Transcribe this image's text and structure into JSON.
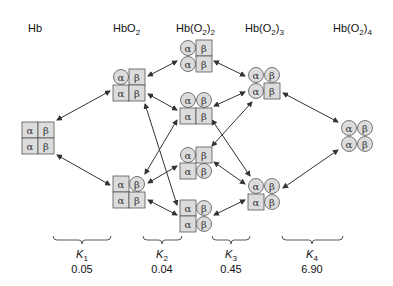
{
  "diagram": {
    "columns": [
      {
        "id": "hb",
        "label": "Hb",
        "x": 28
      },
      {
        "id": "hbo2",
        "label": "HbO",
        "sub": "2",
        "x": 113
      },
      {
        "id": "hbo2_2",
        "label": "Hb(O",
        "sub1": "2",
        "mid": ")",
        "sub2": "2",
        "x": 176
      },
      {
        "id": "hbo2_3",
        "label": "Hb(O",
        "sub1": "2",
        "mid": ")",
        "sub2": "3",
        "x": 245
      },
      {
        "id": "hbo2_4",
        "label": "Hb(O",
        "sub1": "2",
        "mid": ")",
        "sub2": "4",
        "x": 333
      }
    ],
    "subunit_glyphs": {
      "alpha": "α",
      "beta": "β"
    },
    "colors": {
      "fill": "#dcdcdc",
      "stroke": "#555555",
      "arrow": "#333333",
      "text": "#111111"
    },
    "states": [
      {
        "id": "hb",
        "x": 22,
        "y": 122,
        "cells": [
          "sq",
          "sq",
          "sq",
          "sq"
        ]
      },
      {
        "id": "hbo2-a",
        "x": 113,
        "y": 69,
        "cells": [
          "ci",
          "sq",
          "sq",
          "sq"
        ]
      },
      {
        "id": "hbo2-b",
        "x": 113,
        "y": 176,
        "cells": [
          "sq",
          "ci",
          "sq",
          "sq"
        ]
      },
      {
        "id": "hbo2_2-a",
        "x": 180,
        "y": 40,
        "cells": [
          "ci",
          "sq",
          "ci",
          "sq"
        ]
      },
      {
        "id": "hbo2_2-b",
        "x": 180,
        "y": 92,
        "cells": [
          "ci",
          "ci",
          "sq",
          "sq"
        ]
      },
      {
        "id": "hbo2_2-c",
        "x": 180,
        "y": 147,
        "cells": [
          "ci",
          "sq",
          "sq",
          "ci"
        ]
      },
      {
        "id": "hbo2_2-d",
        "x": 180,
        "y": 200,
        "cells": [
          "sq",
          "ci",
          "sq",
          "ci"
        ]
      },
      {
        "id": "hbo2_3-a",
        "x": 248,
        "y": 67,
        "cells": [
          "ci",
          "ci",
          "ci",
          "sq"
        ]
      },
      {
        "id": "hbo2_3-b",
        "x": 248,
        "y": 178,
        "cells": [
          "ci",
          "ci",
          "sq",
          "ci"
        ]
      },
      {
        "id": "hbo2_4",
        "x": 341,
        "y": 120,
        "cells": [
          "ci",
          "ci",
          "ci",
          "ci"
        ]
      }
    ],
    "arrows": [
      {
        "from": "hb",
        "to": "hbo2-a",
        "x1": 57,
        "y1": 120,
        "x2": 110,
        "y2": 91
      },
      {
        "from": "hb",
        "to": "hbo2-b",
        "x1": 57,
        "y1": 155,
        "x2": 110,
        "y2": 185
      },
      {
        "from": "hbo2-a",
        "to": "hbo2_2-a",
        "x1": 148,
        "y1": 76,
        "x2": 177,
        "y2": 61
      },
      {
        "from": "hbo2-a",
        "to": "hbo2_2-b",
        "x1": 148,
        "y1": 94,
        "x2": 177,
        "y2": 110
      },
      {
        "from": "hbo2-a",
        "to": "hbo2_2-d",
        "x1": 145,
        "y1": 104,
        "x2": 177,
        "y2": 205
      },
      {
        "from": "hbo2-b",
        "to": "hbo2_2-c",
        "x1": 148,
        "y1": 183,
        "x2": 177,
        "y2": 166
      },
      {
        "from": "hbo2-b",
        "to": "hbo2_2-d",
        "x1": 148,
        "y1": 200,
        "x2": 177,
        "y2": 215
      },
      {
        "from": "hbo2-b",
        "to": "hbo2_2-b",
        "x1": 145,
        "y1": 174,
        "x2": 177,
        "y2": 120
      },
      {
        "from": "hbo2_2-a",
        "to": "hbo2_3-a",
        "x1": 214,
        "y1": 61,
        "x2": 245,
        "y2": 76
      },
      {
        "from": "hbo2_2-b",
        "to": "hbo2_3-a",
        "x1": 214,
        "y1": 106,
        "x2": 245,
        "y2": 92
      },
      {
        "from": "hbo2_2-b",
        "to": "hbo2_3-b",
        "x1": 212,
        "y1": 120,
        "x2": 250,
        "y2": 176
      },
      {
        "from": "hbo2_2-c",
        "to": "hbo2_3-a",
        "x1": 212,
        "y1": 146,
        "x2": 252,
        "y2": 102
      },
      {
        "from": "hbo2_2-c",
        "to": "hbo2_3-b",
        "x1": 214,
        "y1": 162,
        "x2": 245,
        "y2": 184
      },
      {
        "from": "hbo2_2-d",
        "to": "hbo2_3-b",
        "x1": 214,
        "y1": 215,
        "x2": 245,
        "y2": 200
      },
      {
        "from": "hbo2_3-a",
        "to": "hbo2_4",
        "x1": 283,
        "y1": 93,
        "x2": 338,
        "y2": 122
      },
      {
        "from": "hbo2_3-b",
        "to": "hbo2_4",
        "x1": 283,
        "y1": 188,
        "x2": 338,
        "y2": 150
      }
    ],
    "constants": [
      {
        "name": "K",
        "sub": "1",
        "value": "0.05",
        "bx1": 53,
        "bx2": 111,
        "cx": 82
      },
      {
        "name": "K",
        "sub": "2",
        "value": "0.04",
        "bx1": 143,
        "bx2": 182,
        "cx": 162
      },
      {
        "name": "K",
        "sub": "3",
        "value": "0.45",
        "bx1": 212,
        "bx2": 250,
        "cx": 231
      },
      {
        "name": "K",
        "sub": "4",
        "value": "6.90",
        "bx1": 282,
        "bx2": 343,
        "cx": 312
      }
    ]
  }
}
